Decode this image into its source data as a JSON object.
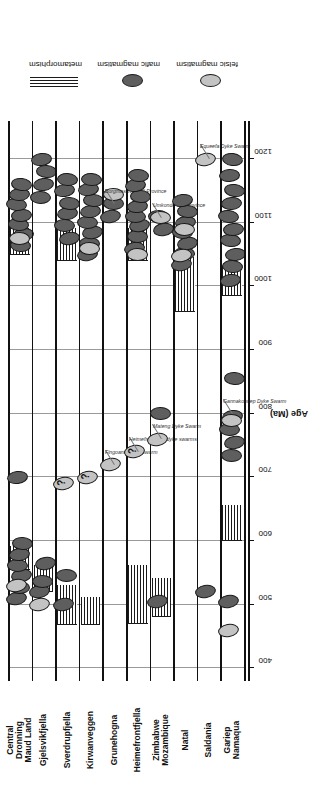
{
  "chart_data": {
    "type": "scatter",
    "title": "",
    "xlabel": "Age (Ma)",
    "ylabel": "",
    "axis_title": "Age (Ma)",
    "xlim": [
      380,
      1260
    ],
    "ticks": [
      400,
      500,
      600,
      700,
      800,
      900,
      1000,
      1100,
      1200
    ],
    "ticklabels": [
      "400",
      "500",
      "600",
      "700",
      "800",
      "900",
      "1000",
      "1100",
      "1200"
    ],
    "grid": "vertical gridlines at every 100 Ma tick",
    "legend_position": "right",
    "legend": [
      {
        "key": "metamorphism",
        "label": "metamorphism",
        "symbol": "horizontal-hatch-band",
        "color": "#1a1a1a"
      },
      {
        "key": "mafic",
        "label": "mafic magmatism",
        "symbol": "dark-ellipse",
        "color": "#5e5e5e"
      },
      {
        "key": "felsic",
        "label": "felsic magmatism",
        "symbol": "light-ellipse",
        "color": "#c3c3c3"
      }
    ],
    "rows": [
      {
        "name": "Central Dronning Maud Land",
        "label_lines": [
          "Central",
          "Dronning",
          "Maud Land"
        ],
        "metamorphism": [
          {
            "from": 555,
            "to": 590
          },
          {
            "from": 1050,
            "to": 1090
          }
        ],
        "mafic": [
          510,
          527,
          545,
          562,
          578,
          596,
          700,
          1065,
          1082,
          1098,
          1112,
          1128,
          1145,
          1160
        ],
        "felsic": [
          530,
          1075
        ]
      },
      {
        "name": "Gjelsvikfjella",
        "label_lines": [
          "Gjelsvikfjella"
        ],
        "metamorphism": [
          {
            "from": 520,
            "to": 560
          }
        ],
        "mafic": [
          520,
          536,
          565,
          1140,
          1160,
          1180,
          1200
        ],
        "felsic": [
          500
        ]
      },
      {
        "name": "Sverdrupfjella",
        "label_lines": [
          "Sverdrupfjella"
        ],
        "metamorphism": [
          {
            "from": 468,
            "to": 530
          },
          {
            "from": 1040,
            "to": 1090
          }
        ],
        "mafic": [
          500,
          545,
          1075,
          1095,
          1115,
          1130,
          1150,
          1168
        ],
        "felsic": [
          690
        ],
        "queried": [
          690
        ]
      },
      {
        "name": "Kirwanveggen",
        "label_lines": [
          "Kirwanveggen"
        ],
        "metamorphism": [
          {
            "from": 468,
            "to": 510
          }
        ],
        "mafic": [
          1050,
          1068,
          1085,
          1100,
          1118,
          1135,
          1152,
          1168
        ],
        "felsic": [
          700,
          1060
        ],
        "queried": [
          700
        ]
      },
      {
        "name": "Grunehogna",
        "label_lines": [
          "Grunehogna"
        ],
        "metamorphism": [],
        "mafic": [
          1110,
          1130
        ],
        "felsic": [
          720,
          1145
        ],
        "annotations": [
          {
            "text": "Fingoane Dyke Swarm",
            "age": 720
          },
          {
            "text": "Borgmassivet Sill Province",
            "age": 1130
          }
        ]
      },
      {
        "name": "Heimefrontfjella",
        "label_lines": [
          "Heimefrontfjella"
        ],
        "metamorphism": [
          {
            "from": 470,
            "to": 560
          },
          {
            "from": 1040,
            "to": 1090
          }
        ],
        "mafic": [
          1060,
          1078,
          1095,
          1110,
          1126,
          1142,
          1158,
          1175
        ],
        "felsic": [
          740,
          1050
        ],
        "queried": [
          740
        ],
        "annotations": [
          {
            "text": "Heimefrontfjella dyke swarms",
            "age": 740
          }
        ]
      },
      {
        "name": "Zimbabwe Mozambique",
        "label_lines": [
          "Zimbabwe",
          "Mozambique"
        ],
        "metamorphism": [
          {
            "from": 480,
            "to": 540
          }
        ],
        "mafic": [
          505,
          800,
          1090,
          1110
        ],
        "felsic": [
          760,
          1108
        ],
        "annotations": [
          {
            "text": "Mateng Dyke Swarm",
            "age": 760
          },
          {
            "text": "Umkondo Sill Province",
            "age": 1108
          }
        ]
      },
      {
        "name": "Natal",
        "label_lines": [
          "Natal"
        ],
        "metamorphism": [
          {
            "from": 960,
            "to": 1045
          }
        ],
        "mafic": [
          1035,
          1052,
          1068,
          1085,
          1100,
          1118,
          1135
        ],
        "felsic": [
          1048,
          1090
        ]
      },
      {
        "name": "Saldania",
        "label_lines": [
          "Saldania"
        ],
        "metamorphism": [],
        "mafic": [
          520
        ],
        "felsic": [
          1200
        ],
        "annotations": [
          {
            "text": "Equeefa Dyke Swarm",
            "age": 1200
          }
        ]
      },
      {
        "name": "Gariep Namaqua",
        "label_lines": [
          "Gariep",
          "Namaqua"
        ],
        "metamorphism": [
          {
            "from": 600,
            "to": 655
          },
          {
            "from": 985,
            "to": 1030
          }
        ],
        "mafic": [
          505,
          735,
          755,
          775,
          795,
          855,
          1010,
          1032,
          1050,
          1072,
          1090,
          1110,
          1130,
          1150,
          1175,
          1200
        ],
        "felsic": [
          460,
          790
        ],
        "annotations": [
          {
            "text": "Gannakouriep Dyke Swarm",
            "age": 800
          }
        ]
      }
    ]
  },
  "figure": {
    "axis_title": "Age (Ma)",
    "legend_labels": {
      "metamorphism": "metamorphism",
      "mafic": "mafic magmatism",
      "felsic": "felsic magmatism"
    }
  }
}
